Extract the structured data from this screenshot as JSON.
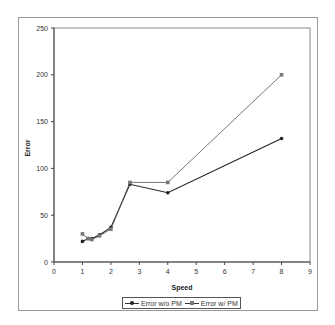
{
  "chart_data": {
    "type": "line",
    "title": "",
    "xlabel": "Speed",
    "ylabel": "Error",
    "xlim": [
      0,
      9
    ],
    "ylim": [
      0,
      250
    ],
    "x_ticks": [
      "0",
      "1",
      "2",
      "3",
      "4",
      "5",
      "6",
      "7",
      "8",
      "9"
    ],
    "y_ticks": [
      "0",
      "50",
      "100",
      "150",
      "200",
      "250"
    ],
    "grid": false,
    "legend_position": "bottom",
    "series": [
      {
        "name": "Error w/o PM",
        "marker": "circle",
        "color": "#222222",
        "x": [
          1,
          1.2,
          1.33,
          1.6,
          2,
          2.67,
          4,
          8
        ],
        "y": [
          22,
          25,
          25,
          29,
          37,
          83,
          74,
          132
        ]
      },
      {
        "name": "Error w/ PM",
        "marker": "square",
        "color": "#555555",
        "x": [
          1,
          1.2,
          1.33,
          1.6,
          2,
          2.67,
          4,
          8
        ],
        "y": [
          30,
          25,
          24,
          28,
          35,
          85,
          85,
          200
        ]
      }
    ]
  },
  "legend": {
    "items": [
      {
        "label": "Error w/o PM"
      },
      {
        "label": "Error w/ PM"
      }
    ]
  }
}
